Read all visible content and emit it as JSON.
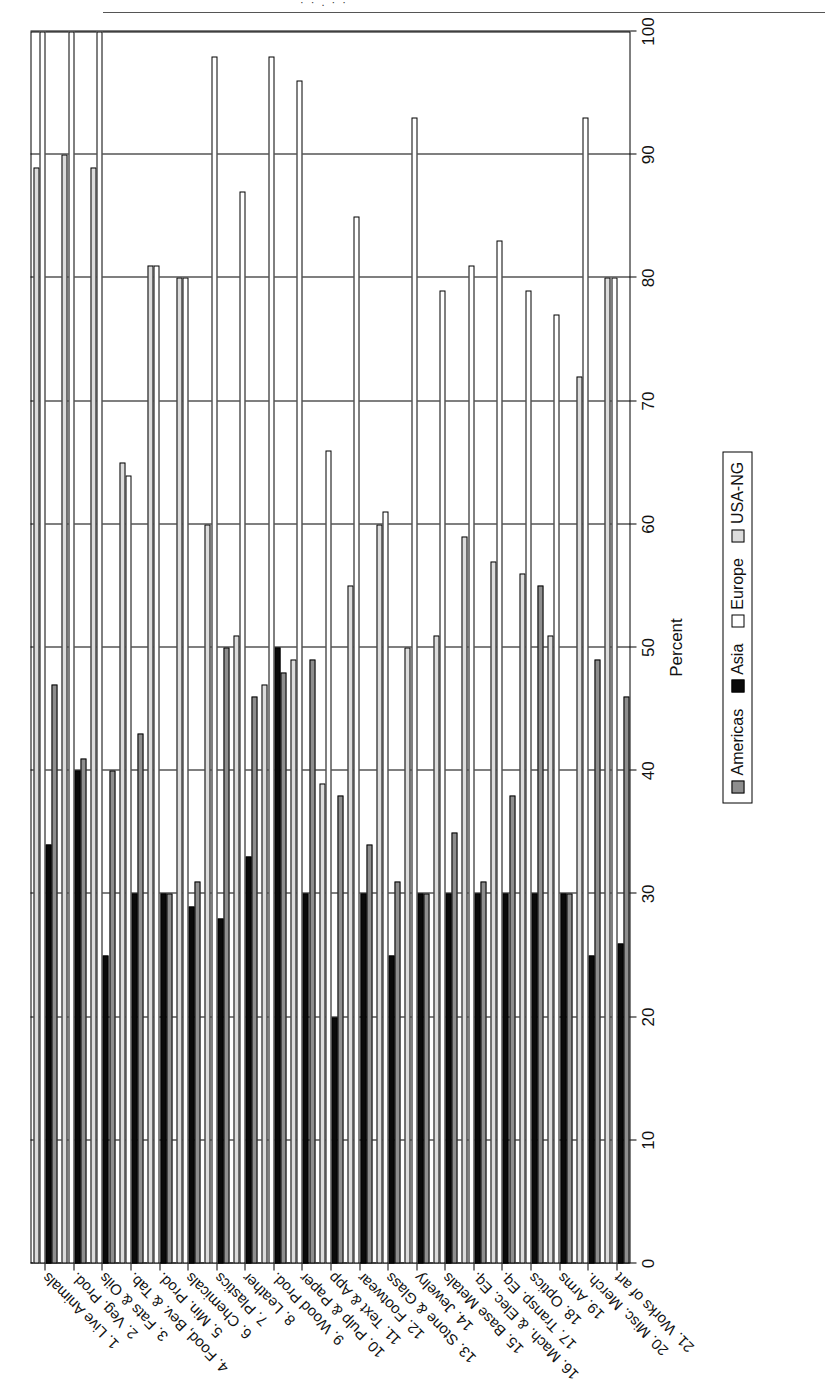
{
  "page": {
    "top_crop_text": "· · , ·            ·",
    "orientation_note": "rotated"
  },
  "chart_data": {
    "type": "bar",
    "orientation": "horizontal-grouped",
    "title": "",
    "xlabel": "Percent",
    "ylabel": "",
    "xlim": [
      0,
      100
    ],
    "grid": true,
    "legend_position": "right-bottom",
    "tick_labels": [
      "0",
      "10",
      "20",
      "30",
      "40",
      "50",
      "60",
      "70",
      "80",
      "90",
      "100"
    ],
    "tick_values": [
      0,
      10,
      20,
      30,
      40,
      50,
      60,
      70,
      80,
      90,
      100
    ],
    "categories": [
      "1. Live Animals",
      "2. Veg. Prod.",
      "3. Fats & Oils",
      "4. Food, Bev. & Tab.",
      "5. Min. Prod.",
      "6. Chemicals",
      "7. Plastics",
      "8. Leather",
      "9. Wood Prod.",
      "10. Pulp & Paper",
      "11. Text & App",
      "12. Footwear",
      "13. Stone & Glass",
      "14. Jewelry",
      "15. Base Metals",
      "16. Mach. & Elec. Eq.",
      "17. Transp. Eq.",
      "18. Optics",
      "19. Arms",
      "20. Misc. Merch.",
      "21. Works of art"
    ],
    "series": [
      {
        "name": "Americas",
        "color": "#8e8e8e",
        "values": [
          47,
          41,
          40,
          43,
          30,
          31,
          50,
          46,
          48,
          49,
          38,
          34,
          31,
          30,
          35,
          31,
          38,
          55,
          30,
          49,
          46
        ]
      },
      {
        "name": "Asia",
        "color": "#0a0a0a",
        "values": [
          34,
          40,
          25,
          30,
          30,
          29,
          28,
          33,
          50,
          30,
          20,
          30,
          25,
          30,
          30,
          30,
          30,
          30,
          30,
          25,
          26
        ]
      },
      {
        "name": "Europe",
        "color": "#ffffff",
        "values": [
          100,
          100,
          100,
          64,
          81,
          80,
          98,
          87,
          98,
          96,
          66,
          85,
          61,
          93,
          79,
          81,
          83,
          79,
          77,
          93,
          80
        ]
      },
      {
        "name": "USA-NG",
        "color": "#dcdcdc",
        "values": [
          89,
          90,
          89,
          65,
          81,
          80,
          60,
          51,
          47,
          49,
          39,
          55,
          60,
          50,
          51,
          59,
          57,
          56,
          51,
          72,
          80
        ]
      }
    ],
    "legend_labels": [
      "Americas",
      "Asia",
      "Europe",
      "USA-NG"
    ]
  }
}
